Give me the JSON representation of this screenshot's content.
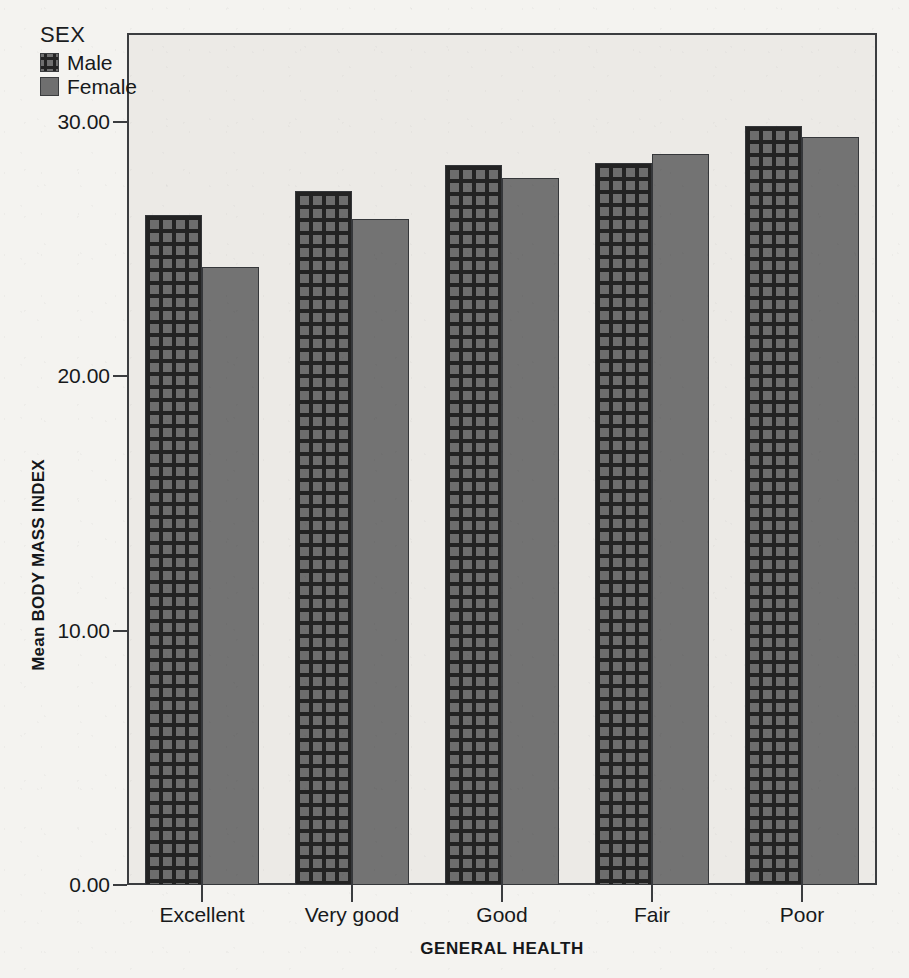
{
  "chart_data": {
    "type": "bar",
    "title": "",
    "subtitle": "",
    "xlabel": "GENERAL HEALTH",
    "ylabel": "Mean BODY MASS INDEX",
    "categories": [
      "Excellent",
      "Very good",
      "Good",
      "Fair",
      "Poor"
    ],
    "series": [
      {
        "name": "Male",
        "values": [
          26.35,
          27.3,
          28.3,
          28.4,
          29.85
        ]
      },
      {
        "name": "Female",
        "values": [
          24.3,
          26.2,
          27.8,
          28.75,
          29.4
        ]
      }
    ],
    "legend_title": "SEX",
    "legend_position": "inside-top-left",
    "ylim": [
      0,
      30
    ],
    "ytick_labels": [
      "0.00",
      "10.00",
      "20.00",
      "30.00"
    ],
    "ytick_values": [
      0,
      10,
      20,
      30
    ],
    "grid": false,
    "colors": {
      "male_fill": "#6d6d6d",
      "male_hatch": "#232323",
      "female_fill": "#737373",
      "axis": "#3b3d40",
      "plot_background": "#eceae6",
      "page_background": "#f4f3f0",
      "text": "#17191b"
    }
  },
  "axes": {
    "y_title": "Mean BODY MASS INDEX",
    "x_title": "GENERAL HEALTH"
  },
  "legend": {
    "title": "SEX",
    "entries": [
      {
        "label": "Male",
        "swatch": "grid-hatch-swatch"
      },
      {
        "label": "Female",
        "swatch": "solid-gray-swatch"
      }
    ]
  }
}
